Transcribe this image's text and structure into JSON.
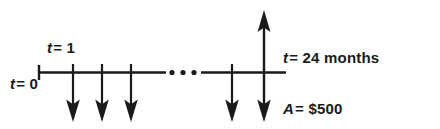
{
  "diagram": {
    "type": "cash-flow-timeline",
    "colors": {
      "background": "#ffffff",
      "stroke": "#1a1a1a",
      "text": "#1a1a1a"
    },
    "labels": {
      "t_start": {
        "variable": "t",
        "equals": "=",
        "value": "0",
        "full": "t = 0"
      },
      "t_first": {
        "variable": "t",
        "equals": "=",
        "value": "1",
        "full": "t = 1"
      },
      "t_end": {
        "variable": "t",
        "equals": "=",
        "value": "24 months",
        "full": "t = 24 months"
      },
      "amount": {
        "variable": "A",
        "equals": "=",
        "value": "$500",
        "full": "A = $500"
      }
    },
    "axis": {
      "x_start": 38,
      "x_end": 286,
      "y_baseline": 72,
      "break_dots_count": 3,
      "break_dot_x": [
        172,
        183,
        194
      ]
    },
    "outflows": [
      {
        "index": 1,
        "x": 73,
        "direction": "down",
        "label": "t = 1 payment"
      },
      {
        "index": 2,
        "x": 102,
        "direction": "down",
        "label": "payment"
      },
      {
        "index": 3,
        "x": 131,
        "direction": "down",
        "label": "payment"
      },
      {
        "index": 4,
        "x": 232,
        "direction": "down",
        "label": "payment"
      }
    ],
    "net_arrow": {
      "x": 264,
      "direction": "double",
      "top_y": 10,
      "bottom_y": 121,
      "label": "A = $500"
    }
  }
}
